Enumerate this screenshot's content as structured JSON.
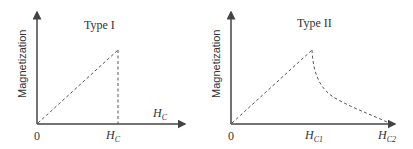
{
  "panels": [
    {
      "title": "Type I",
      "ylabel": "Magnetization",
      "origin_label": "0",
      "x_ticks": [
        {
          "main": "H",
          "sub": "C"
        }
      ],
      "extra_label": {
        "main": "H",
        "sub": "C"
      }
    },
    {
      "title": "Type II",
      "ylabel": "Magnetization",
      "origin_label": "0",
      "x_ticks": [
        {
          "main": "H",
          "sub": "C1"
        },
        {
          "main": "H",
          "sub": "C2"
        }
      ]
    }
  ],
  "colors": {
    "axis": "#444444",
    "curve": "#555555",
    "text": "#333333"
  }
}
